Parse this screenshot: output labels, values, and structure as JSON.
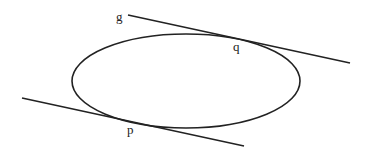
{
  "diagram": {
    "stroke_color": "#222222",
    "ellipse": {
      "cx": 186,
      "cy": 81,
      "rx": 114,
      "ry": 47
    },
    "tangent_lines": [
      {
        "name": "g",
        "x1": 128,
        "y1": 15,
        "x2": 350,
        "y2": 63,
        "touch_point": "q"
      },
      {
        "name": "lower",
        "x1": 22,
        "y1": 98,
        "x2": 244,
        "y2": 146,
        "touch_point": "p"
      }
    ],
    "labels": {
      "g": "g",
      "q": "q",
      "p": "p"
    }
  }
}
